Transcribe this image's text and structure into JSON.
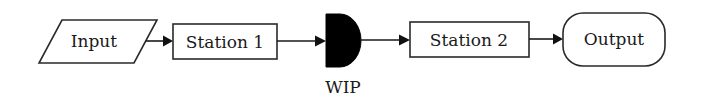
{
  "diagram": {
    "type": "flowchart",
    "direction": "left-to-right",
    "nodes": [
      {
        "id": "input",
        "label": "Input",
        "shape": "parallelogram"
      },
      {
        "id": "station1",
        "label": "Station 1",
        "shape": "rectangle"
      },
      {
        "id": "wip",
        "label": "WIP",
        "shape": "delay (filled D-shape)",
        "label_position": "below"
      },
      {
        "id": "station2",
        "label": "Station 2",
        "shape": "rectangle"
      },
      {
        "id": "output",
        "label": "Output",
        "shape": "terminator (rounded)"
      }
    ],
    "edges": [
      {
        "from": "input",
        "to": "station1"
      },
      {
        "from": "station1",
        "to": "wip"
      },
      {
        "from": "wip",
        "to": "station2"
      },
      {
        "from": "station2",
        "to": "output"
      }
    ]
  },
  "labels": {
    "input": "Input",
    "station1": "Station 1",
    "wip": "WIP",
    "station2": "Station 2",
    "output": "Output"
  },
  "colors": {
    "stroke": "#2a2a2a",
    "wip_fill": "#000000",
    "background": "#ffffff"
  }
}
